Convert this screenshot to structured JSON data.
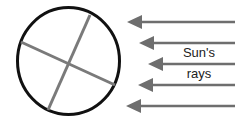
{
  "diagram": {
    "labels": {
      "rays_line1": "Sun's",
      "rays_line2": "rays"
    },
    "colors": {
      "circle": "#111111",
      "axis_lines": "#7a7a7a",
      "arrows": "#6e6e6e",
      "text": "#222222"
    },
    "arrows": [
      {
        "y": 22,
        "tip_x": 127,
        "tail_x": 235
      },
      {
        "y": 43,
        "tip_x": 139,
        "tail_x": 235
      },
      {
        "y": 64,
        "tip_x": 148,
        "tail_x": 235
      },
      {
        "y": 85,
        "tip_x": 138,
        "tail_x": 235
      },
      {
        "y": 106,
        "tip_x": 126,
        "tail_x": 235
      }
    ]
  }
}
